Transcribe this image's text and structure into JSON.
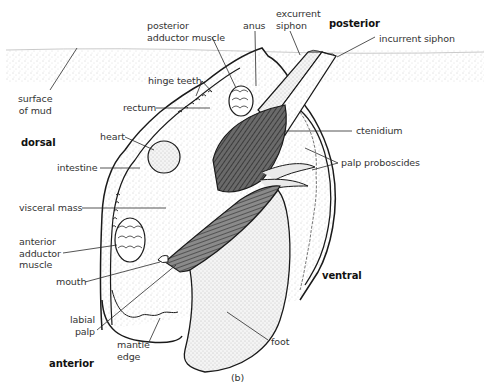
{
  "figure": {
    "panel_label": "(b)"
  },
  "orientation_labels": {
    "posterior": "posterior",
    "dorsal": "dorsal",
    "ventral": "ventral",
    "anterior": "anterior"
  },
  "labels": {
    "posterior_adductor_muscle": "posterior\nadductor muscle",
    "anus": "anus",
    "excurrent_siphon": "excurrent\nsiphon",
    "incurrent_siphon": "incurrent siphon",
    "hinge_teeth": "hinge teeth",
    "surface_of_mud": "surface\nof mud",
    "rectum": "rectum",
    "ctenidium": "ctenidium",
    "heart": "heart",
    "palp_proboscides": "palp proboscides",
    "intestine": "intestine",
    "visceral_mass": "visceral mass",
    "anterior_adductor_muscle": "anterior\nadductor\nmuscle",
    "mouth": "mouth",
    "labial_palp": "labial\npalp",
    "mantle_edge": "mantle\nedge",
    "foot": "foot"
  },
  "colors": {
    "ink": "#1a1a1a",
    "label_text": "#333333",
    "mud_stipple": "#c8c8c8",
    "body_fill": "#f3f3f3",
    "gill_fill": "#555555",
    "background": "#ffffff"
  }
}
